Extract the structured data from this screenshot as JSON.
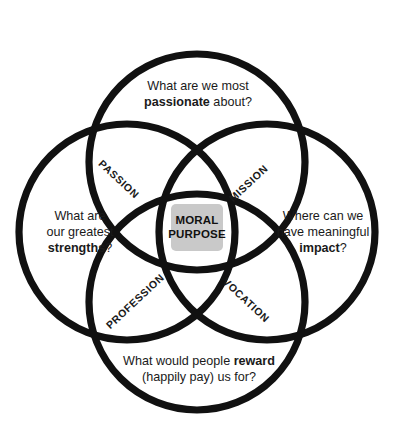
{
  "diagram": {
    "type": "four-circle-venn",
    "center": {
      "line1": "MORAL",
      "line2": "PURPOSE",
      "fill_color": "#c9c9c9"
    },
    "stroke_color": "#111111",
    "background_color": "#ffffff",
    "overlap_labels": [
      {
        "key": "passion",
        "label": "PASSION"
      },
      {
        "key": "mission",
        "label": "MISSION"
      },
      {
        "key": "profession",
        "label": "PROFESSION"
      },
      {
        "key": "vocation",
        "label": "VOCATION"
      }
    ],
    "circle_questions": {
      "top": {
        "line1_prefix": "What are we most",
        "line2_bold": "passionate",
        "line2_suffix": " about?"
      },
      "left": {
        "line1": "What are",
        "line2": "our greatest",
        "line3_bold": "strengths",
        "line3_suffix": "?"
      },
      "right": {
        "line1": "Where can we",
        "line2": "have meaningful",
        "line3_bold": "impact",
        "line3_suffix": "?"
      },
      "bottom": {
        "line1_prefix": "What would people ",
        "line1_bold": "reward",
        "line2": "(happily pay) us for?"
      }
    }
  }
}
